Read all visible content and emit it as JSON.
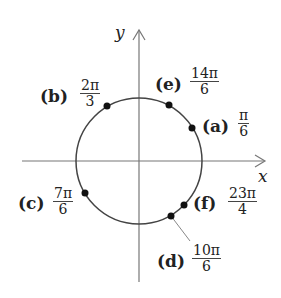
{
  "diagram": {
    "type": "unit-circle",
    "axes": {
      "x_label": "x",
      "y_label": "y"
    },
    "colors": {
      "line": "#444444",
      "point": "#111111",
      "axis": "#777777"
    },
    "points": [
      {
        "id": "a",
        "tag": "(a)",
        "num": "π",
        "den": "6",
        "cx": 192,
        "cy": 128
      },
      {
        "id": "b",
        "tag": "(b)",
        "num": "2π",
        "den": "3",
        "cx": 107,
        "cy": 106
      },
      {
        "id": "c",
        "tag": "(c)",
        "num": "7π",
        "den": "6",
        "cx": 85,
        "cy": 193
      },
      {
        "id": "d",
        "tag": "(d)",
        "num": "10π",
        "den": "6",
        "cx": 171,
        "cy": 216
      },
      {
        "id": "e",
        "tag": "(e)",
        "num": "14π",
        "den": "6",
        "cx": 169,
        "cy": 105
      },
      {
        "id": "f",
        "tag": "(f)",
        "num": "23π",
        "den": "4",
        "cx": 184,
        "cy": 205
      }
    ]
  }
}
